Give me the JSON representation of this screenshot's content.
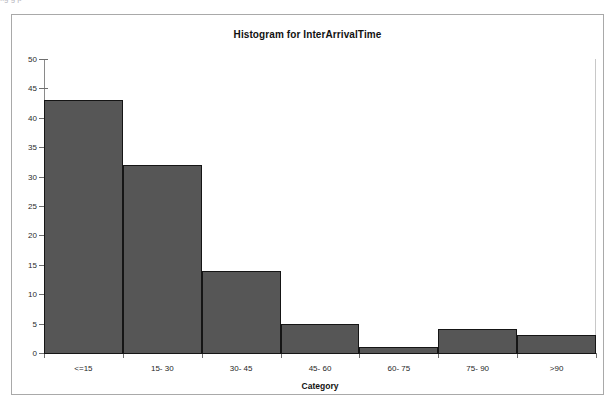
{
  "top_cut_text": "fig        g                                                                                                                                        p",
  "frame": {
    "border_color": "#a9a9a9",
    "background": "#ffffff"
  },
  "chart_data": {
    "type": "bar",
    "title": "Histogram for InterArrivalTime",
    "xlabel": "Category",
    "ylabel": "",
    "categories": [
      "<=15",
      "15- 30",
      "30- 45",
      "45- 60",
      "60- 75",
      "75- 90",
      ">90"
    ],
    "values": [
      43,
      32,
      14,
      5,
      1,
      4,
      3
    ],
    "ylim": [
      0,
      50
    ],
    "yticks": [
      0,
      5,
      10,
      15,
      20,
      25,
      30,
      35,
      40,
      45,
      50
    ],
    "ytick_labels": [
      "0",
      "5",
      "10",
      "15",
      "20",
      "25",
      "30",
      "35",
      "40",
      "45",
      "50"
    ],
    "grid": false,
    "legend": null,
    "bar_fill_color": "#565656",
    "bar_border_color": "#151515",
    "axis_color": "#6f6f6f"
  }
}
